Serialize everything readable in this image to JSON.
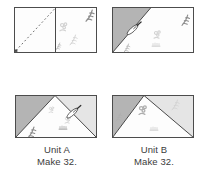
{
  "page": {
    "background": "#ffffff"
  },
  "colors": {
    "page_bg": "#ffffff",
    "outline": "#4c4c4c",
    "seam": "#4a4a4a",
    "gray_fabric": "#b4b4b4",
    "light_fabric": "#e5e5e5",
    "white_fabric": "#fdfdfd",
    "dashed_line": "#5e5e5e",
    "motif_faint": "#d3d3d3",
    "motif_mid": "#aeaeae",
    "motif_dark": "#8b8b8b",
    "needle_body": "#ffffff",
    "needle_edge": "#2e2e2e",
    "needle_eye": "#4a4a4a",
    "text": "#3b3b3b"
  },
  "units": {
    "unit_a": {
      "name": "Unit A",
      "make": "Make 32."
    },
    "unit_b": {
      "name": "Unit B",
      "make": "Make 32."
    }
  },
  "icons": {
    "needle": "needle-icon",
    "stitch_line": "dashed-stitch-line-icon",
    "fabric_motif": "fabric-print-motif"
  }
}
